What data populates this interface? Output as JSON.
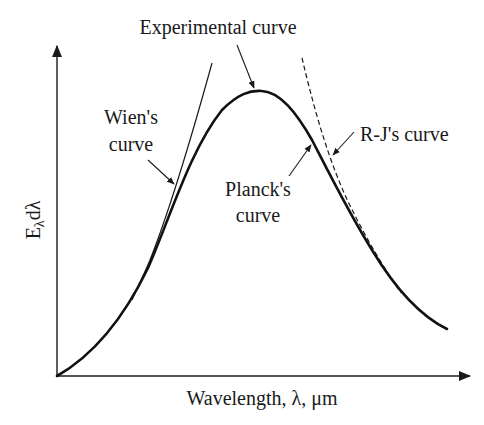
{
  "figure": {
    "title": "",
    "labels": {
      "experimental": "Experimental curve",
      "wien_line1": "Wien's",
      "wien_line2": "curve",
      "planck_line1": "Planck's",
      "planck_line2": "curve",
      "rj": "R-J's curve"
    },
    "axes": {
      "xlabel": "Wavelength, λ, μm",
      "ylabel_main": "E",
      "ylabel_sub": "λ",
      "ylabel_tail": "dλ"
    },
    "colors": {
      "ink": "#1a1a1a",
      "background": "#ffffff"
    }
  },
  "curves": [
    {
      "name": "Planck's curve / Experimental curve",
      "style": "solid-thick"
    },
    {
      "name": "Wien's curve",
      "style": "solid-thin"
    },
    {
      "name": "R-J's curve",
      "style": "dashed"
    }
  ]
}
